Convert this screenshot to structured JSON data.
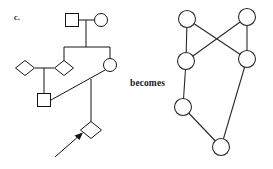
{
  "figure": {
    "panel_label": "c.",
    "becomes_label": "becomes",
    "width": 273,
    "height": 169,
    "background_color": "#ffffff",
    "ink_color": "#141414"
  },
  "pedigree": {
    "caption": "pedigree-with-proband-arrow",
    "stroke_color": "#141414",
    "individuals": [
      {
        "id": "I-1",
        "symbol": "square",
        "cx": 72,
        "cy": 20,
        "size": 13,
        "generation": 1
      },
      {
        "id": "I-2",
        "symbol": "circle",
        "cx": 101,
        "cy": 20,
        "size": 13,
        "generation": 1
      },
      {
        "id": "II-1",
        "symbol": "diamond",
        "cx": 25,
        "cy": 68,
        "size": 15,
        "generation": 2
      },
      {
        "id": "II-2",
        "symbol": "diamond",
        "cx": 64,
        "cy": 68,
        "size": 15,
        "generation": 2
      },
      {
        "id": "II-3",
        "symbol": "circle",
        "cx": 110,
        "cy": 65,
        "size": 13,
        "generation": 2
      },
      {
        "id": "III-1",
        "symbol": "square",
        "cx": 44,
        "cy": 100,
        "size": 13,
        "generation": 3
      },
      {
        "id": "IV-1",
        "symbol": "diamond",
        "cx": 91,
        "cy": 130,
        "size": 15,
        "generation": 4,
        "proband": true
      }
    ],
    "connections": [
      {
        "type": "mating-line",
        "from": "I-1",
        "to": "I-2"
      },
      {
        "type": "descent-line",
        "from": "I-1xI-2",
        "to": "sibship-bar"
      },
      {
        "type": "sibship-bar",
        "children": [
          "II-2",
          "II-3"
        ]
      },
      {
        "type": "mating-line",
        "from": "II-1",
        "to": "II-2"
      },
      {
        "type": "descent-line",
        "from": "II-1xII-2",
        "to": "III-1"
      },
      {
        "type": "diagonal-line",
        "from": "II-3",
        "to": "III-1"
      },
      {
        "type": "descent-line",
        "from": "II-3",
        "to": "IV-1"
      }
    ],
    "proband_arrow": {
      "label": "proband-arrow",
      "from_x": 55,
      "from_y": 157,
      "to_x": 82,
      "to_y": 134
    }
  },
  "graph": {
    "caption": "derived-graph",
    "stroke_color": "#2a2a2a",
    "node_radius": 8.5,
    "nodes": [
      {
        "id": "n1",
        "cx": 187,
        "cy": 19
      },
      {
        "id": "n2",
        "cx": 247,
        "cy": 17
      },
      {
        "id": "n3",
        "cx": 186,
        "cy": 61
      },
      {
        "id": "n4",
        "cx": 247,
        "cy": 59
      },
      {
        "id": "n5",
        "cx": 183,
        "cy": 107
      },
      {
        "id": "n6",
        "cx": 221,
        "cy": 147
      }
    ],
    "edges": [
      {
        "from": "n1",
        "to": "n3"
      },
      {
        "from": "n1",
        "to": "n4"
      },
      {
        "from": "n2",
        "to": "n3"
      },
      {
        "from": "n2",
        "to": "n4"
      },
      {
        "from": "n3",
        "to": "n5"
      },
      {
        "from": "n5",
        "to": "n6"
      },
      {
        "from": "n4",
        "to": "n6"
      }
    ]
  }
}
